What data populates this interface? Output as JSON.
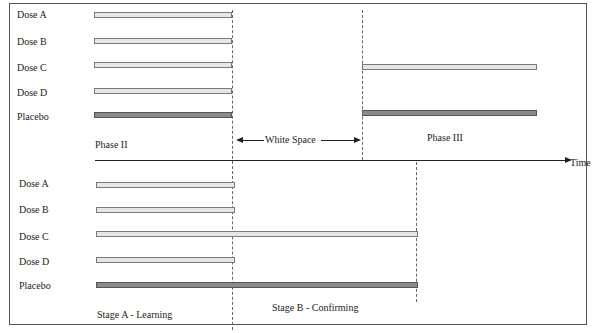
{
  "top": {
    "rows": [
      {
        "label": "Dose A"
      },
      {
        "label": "Dose B"
      },
      {
        "label": "Dose C"
      },
      {
        "label": "Dose D"
      },
      {
        "label": "Placebo"
      }
    ],
    "phase2_label": "Phase II",
    "phase3_label": "Phase III",
    "white_space_label": "White Space"
  },
  "timeline": {
    "label": "Time"
  },
  "bottom": {
    "rows": [
      {
        "label": "Dose A"
      },
      {
        "label": "Dose B"
      },
      {
        "label": "Dose C"
      },
      {
        "label": "Dose D"
      },
      {
        "label": "Placebo"
      }
    ],
    "stage_a_label": "Stage A - Learning",
    "stage_b_label": "Stage B - Confirming"
  },
  "colors": {
    "active_dose_bar": "#e6e6e6",
    "placebo_bar": "#8a8a8a"
  }
}
